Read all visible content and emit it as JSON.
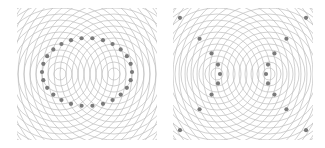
{
  "panels": [
    {
      "id": "ellipse",
      "label": "Ellipse from two-source circular wave interference (constant sum of distances)",
      "foci": [
        [
          43,
          66
        ],
        [
          97,
          66
        ]
      ],
      "ring_spacing": 6,
      "ring_count": 24,
      "curve": {
        "type": "ellipse",
        "cx": 70,
        "cy": 64,
        "rx": 45,
        "ry": 34,
        "dot_count": 26
      }
    },
    {
      "id": "hyperbola",
      "label": "Hyperbola from two-source circular wave interference (constant difference of distances)",
      "foci": [
        [
          44,
          66
        ],
        [
          96,
          66
        ]
      ],
      "ring_spacing": 6,
      "ring_count": 24,
      "curve": {
        "type": "hyperbola",
        "cx": 70,
        "cy": 66,
        "a": 23,
        "b": 22,
        "dots_per_branch": 13
      }
    }
  ],
  "colors": {
    "ring": "#bdbdbd",
    "dot": "#7a7a7a",
    "background": "#ffffff"
  }
}
